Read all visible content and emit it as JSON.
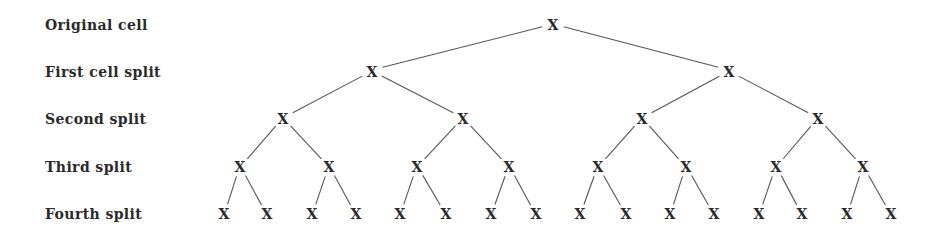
{
  "levels": [
    {
      "label": "Original cell",
      "y": 26
    },
    {
      "label": "First cell split",
      "y": 73
    },
    {
      "label": "Second split",
      "y": 120
    },
    {
      "label": "Third split",
      "y": 168
    },
    {
      "label": "Fourth split",
      "y": 215
    }
  ],
  "node_glyph": "X",
  "tree": {
    "level0": [
      553
    ],
    "level1": [
      372,
      729
    ],
    "level2": [
      283,
      463,
      642,
      818
    ],
    "level3": [
      240,
      329,
      417,
      509,
      598,
      686,
      776,
      863
    ],
    "level4": [
      224,
      267,
      312,
      356,
      400,
      446,
      491,
      536,
      580,
      626,
      670,
      714,
      759,
      802,
      847,
      891
    ]
  },
  "colors": {
    "text": "#2a2a2a",
    "edge": "#555555",
    "background": "#ffffff"
  }
}
